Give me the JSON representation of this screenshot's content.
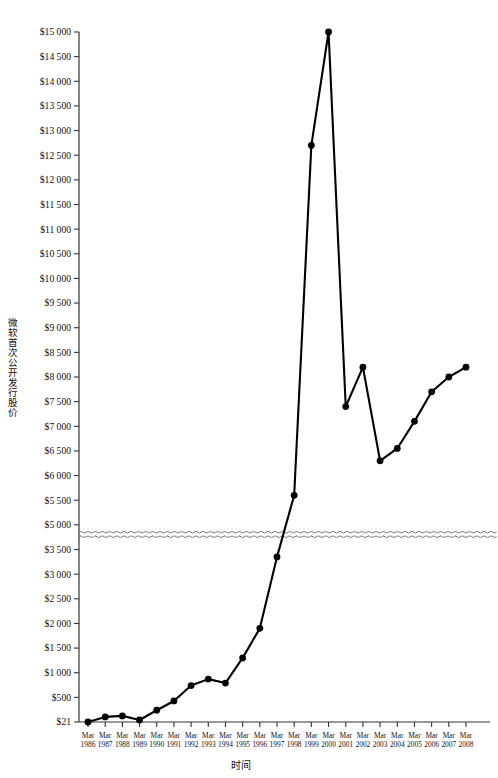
{
  "chart_data": {
    "type": "line",
    "title": "",
    "xlabel": "时间",
    "ylabel": "微软首次公开发行股价",
    "x": [
      "Mar 1986",
      "Mar 1987",
      "Mar 1988",
      "Mar 1989",
      "Mar 1990",
      "Mar 1991",
      "Mar 1992",
      "Mar 1993",
      "Mar 1994",
      "Mar 1995",
      "Mar 1996",
      "Mar 1997",
      "Mar 1998",
      "Mar 1999",
      "Mar 2000",
      "Mar 2001",
      "Mar 2002",
      "Mar 2003",
      "Mar 2004",
      "Mar 2005",
      "Mar 2006",
      "Mar 2007",
      "Mar 2008"
    ],
    "x_tick_top": [
      "Mar",
      "Mar",
      "Mar",
      "Mar",
      "Mar",
      "Mar",
      "Mar",
      "Mar",
      "Mar",
      "Mar",
      "Mar",
      "Mar",
      "Mar",
      "Mar",
      "Mar",
      "Mar",
      "Mar",
      "Mar",
      "Mar",
      "Mar",
      "Mar",
      "Mar",
      "Mar"
    ],
    "x_tick_bottom": [
      "1986",
      "1987",
      "1988",
      "1989",
      "1990",
      "1991",
      "1992",
      "1993",
      "1994",
      "1995",
      "1996",
      "1997",
      "1998",
      "1999",
      "2000",
      "2001",
      "2002",
      "2003",
      "2004",
      "2005",
      "2006",
      "2007",
      "2008"
    ],
    "values": [
      21,
      120,
      140,
      60,
      250,
      430,
      740,
      870,
      790,
      1300,
      1900,
      3350,
      5600,
      12700,
      15000,
      7400,
      8200,
      6300,
      6550,
      7100,
      7700,
      8000,
      8200
    ],
    "y_tick_labels": [
      "$15 000",
      "$14 500",
      "$14 000",
      "$13 500",
      "$13 000",
      "$12 500",
      "$12 000",
      "$11 500",
      "$11 000",
      "$10 500",
      "$10 000",
      "$9 500",
      "$9 000",
      "$8 500",
      "$8 000",
      "$7 500",
      "$7 000",
      "$6 500",
      "$6 000",
      "$5 500",
      "$5 000",
      "$3 500",
      "$3 000",
      "$2 500",
      "$2 000",
      "$1 500",
      "$1 000",
      "$500",
      "$21"
    ],
    "y_tick_values": [
      15000,
      14500,
      14000,
      13500,
      13000,
      12500,
      12000,
      11500,
      11000,
      10500,
      10000,
      9500,
      9000,
      8500,
      8000,
      7500,
      7000,
      6500,
      6000,
      5500,
      5000,
      3500,
      3000,
      2500,
      2000,
      1500,
      1000,
      500,
      21
    ],
    "ylim": [
      21,
      15000
    ],
    "axis_break": {
      "between": [
        "$5 000",
        "$3 500"
      ],
      "style": "wavy-double-line",
      "present": true
    },
    "grid": false,
    "legend": null,
    "marker": "filled-circle",
    "line_color": "#000000",
    "axis_color": "#333333"
  }
}
